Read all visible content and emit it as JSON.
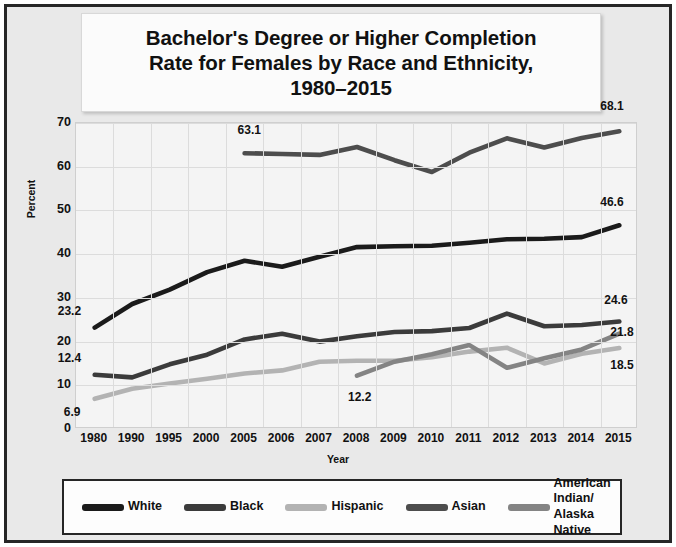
{
  "chart_data": {
    "type": "line",
    "title": "Bachelor's Degree or Higher Completion Rate for Females by Race and Ethnicity, 1980–2015",
    "title_lines": [
      "Bachelor's Degree or Higher Completion",
      "Rate for Females by Race and Ethnicity,",
      "1980–2015"
    ],
    "xlabel": "Year",
    "ylabel": "Percent",
    "ylim": [
      0,
      70
    ],
    "yticks": [
      0,
      10,
      20,
      30,
      40,
      50,
      60,
      70
    ],
    "grid": true,
    "legend_position": "bottom",
    "categories": [
      "1980",
      "1990",
      "1995",
      "2000",
      "2005",
      "2006",
      "2007",
      "2008",
      "2009",
      "2010",
      "2011",
      "2012",
      "2013",
      "2014",
      "2015"
    ],
    "series": [
      {
        "name": "White",
        "color": "#1b1b1b",
        "values": [
          23.2,
          28.6,
          31.9,
          35.9,
          38.5,
          37.1,
          39.4,
          41.6,
          41.8,
          41.9,
          42.6,
          43.4,
          43.5,
          43.9,
          46.6
        ]
      },
      {
        "name": "Black",
        "color": "#3b3b3b",
        "values": [
          12.4,
          11.8,
          14.8,
          17.0,
          20.5,
          21.8,
          20.0,
          21.2,
          22.2,
          22.4,
          23.1,
          26.4,
          23.5,
          23.8,
          24.6
        ]
      },
      {
        "name": "Hispanic",
        "color": "#b3b3b3",
        "values": [
          6.9,
          9.2,
          10.4,
          11.5,
          12.7,
          13.4,
          15.4,
          15.6,
          15.6,
          16.4,
          17.7,
          18.6,
          15.0,
          17.2,
          18.5
        ]
      },
      {
        "name": "Asian",
        "color": "#4d4d4d",
        "values": [
          null,
          null,
          null,
          null,
          63.1,
          62.9,
          62.7,
          64.5,
          61.5,
          58.8,
          63.2,
          66.5,
          64.4,
          66.6,
          68.1
        ]
      },
      {
        "name": "American Indian/ Alaska Native",
        "color": "#848484",
        "values": [
          null,
          null,
          null,
          null,
          null,
          null,
          null,
          12.2,
          15.4,
          17.1,
          19.2,
          14.0,
          16.2,
          18.2,
          21.8
        ]
      }
    ],
    "data_labels": [
      {
        "text": "23.2",
        "series": "White",
        "category": "1980"
      },
      {
        "text": "12.4",
        "series": "Black",
        "category": "1980"
      },
      {
        "text": "6.9",
        "series": "Hispanic",
        "category": "1980"
      },
      {
        "text": "63.1",
        "series": "Asian",
        "category": "2005"
      },
      {
        "text": "12.2",
        "series": "American Indian/ Alaska Native",
        "category": "2008"
      },
      {
        "text": "68.1",
        "series": "Asian",
        "category": "2015"
      },
      {
        "text": "46.6",
        "series": "White",
        "category": "2015"
      },
      {
        "text": "24.6",
        "series": "Black",
        "category": "2015"
      },
      {
        "text": "21.8",
        "series": "American Indian/ Alaska Native",
        "category": "2015"
      },
      {
        "text": "18.5",
        "series": "Hispanic",
        "category": "2015"
      }
    ],
    "legend": [
      {
        "label": "White",
        "color": "#1b1b1b"
      },
      {
        "label": "Black",
        "color": "#3b3b3b"
      },
      {
        "label": "Hispanic",
        "color": "#b3b3b3"
      },
      {
        "label": "Asian",
        "color": "#4d4d4d"
      },
      {
        "label": "American Indian/",
        "label2": "Alaska Native",
        "color": "#848484"
      }
    ]
  }
}
